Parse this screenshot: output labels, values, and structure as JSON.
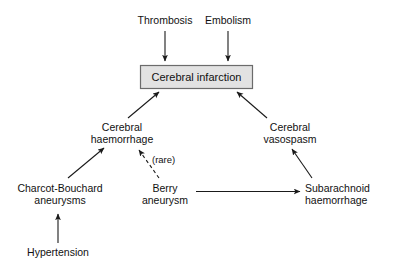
{
  "diagram": {
    "background_color": "#ffffff",
    "box": {
      "label": "Cerebral infarction",
      "fill_color": "#e2e2e2",
      "border_color": "#6b6b6b"
    },
    "nodes": [
      {
        "id": "thrombosis",
        "line1": "Thrombosis",
        "line2": ""
      },
      {
        "id": "embolism",
        "line1": "Embolism",
        "line2": ""
      },
      {
        "id": "cerebral-haemorrhage",
        "line1": "Cerebral",
        "line2": "haemorrhage"
      },
      {
        "id": "cerebral-vasospasm",
        "line1": "Cerebral",
        "line2": "vasospasm"
      },
      {
        "id": "charcot-bouchard-aneurysms",
        "line1": "Charcot-Bouchard",
        "line2": "aneurysms"
      },
      {
        "id": "berry-aneurysm",
        "line1": "Berry",
        "line2": "aneurysm"
      },
      {
        "id": "subarachnoid-haemorrhage",
        "line1": "Subarachnoid",
        "line2": "haemorrhage"
      },
      {
        "id": "hypertension",
        "line1": "Hypertension",
        "line2": ""
      }
    ],
    "edges": [
      {
        "id": "thrombosis-to-infarction",
        "from": "thrombosis",
        "to": "cerebral-infarction",
        "style": "solid",
        "label": ""
      },
      {
        "id": "embolism-to-infarction",
        "from": "embolism",
        "to": "cerebral-infarction",
        "style": "solid",
        "label": ""
      },
      {
        "id": "haemorrhage-to-infarction",
        "from": "cerebral-haemorrhage",
        "to": "cerebral-infarction",
        "style": "solid",
        "label": ""
      },
      {
        "id": "vasospasm-to-infarction",
        "from": "cerebral-vasospasm",
        "to": "cerebral-infarction",
        "style": "solid",
        "label": ""
      },
      {
        "id": "charcot-to-haemorrhage",
        "from": "charcot-bouchard-aneurysms",
        "to": "cerebral-haemorrhage",
        "style": "solid",
        "label": ""
      },
      {
        "id": "berry-to-haemorrhage",
        "from": "berry-aneurysm",
        "to": "cerebral-haemorrhage",
        "style": "dashed",
        "label": "(rare)"
      },
      {
        "id": "berry-to-subarachnoid",
        "from": "berry-aneurysm",
        "to": "subarachnoid-haemorrhage",
        "style": "solid",
        "label": ""
      },
      {
        "id": "subarachnoid-to-vasospasm",
        "from": "subarachnoid-haemorrhage",
        "to": "cerebral-vasospasm",
        "style": "solid",
        "label": ""
      },
      {
        "id": "hypertension-to-charcot",
        "from": "hypertension",
        "to": "charcot-bouchard-aneurysms",
        "style": "solid",
        "label": ""
      }
    ],
    "annotations": {
      "rare": "(rare)"
    }
  }
}
